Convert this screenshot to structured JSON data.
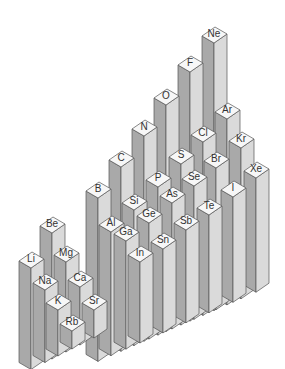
{
  "diagram": {
    "type": "isometric-3d-bar-periodic-table",
    "colors": {
      "top_face": "#f7f7f7",
      "left_face": "#a9a9a9",
      "right_face": "#dadada",
      "edge": "#555555",
      "label": "#333333",
      "background": "#ffffff"
    },
    "left_block": {
      "groups": [
        {
          "group": 1,
          "elements": [
            "Li",
            "Na",
            "K",
            "Rb"
          ]
        },
        {
          "group": 2,
          "elements": [
            "Be",
            "Mg",
            "Ca",
            "Sr"
          ]
        }
      ]
    },
    "right_block": {
      "groups": [
        {
          "group": 13,
          "elements": [
            "B",
            "Al",
            "Ga",
            "In"
          ]
        },
        {
          "group": 14,
          "elements": [
            "C",
            "Si",
            "Ge",
            "Sn"
          ]
        },
        {
          "group": 15,
          "elements": [
            "N",
            "P",
            "As",
            "Sb"
          ]
        },
        {
          "group": 16,
          "elements": [
            "O",
            "S",
            "Se",
            "Te"
          ]
        },
        {
          "group": 17,
          "elements": [
            "F",
            "Cl",
            "Br",
            "I"
          ]
        },
        {
          "group": 18,
          "elements": [
            "Ne",
            "Ar",
            "Kr",
            "Xe"
          ]
        }
      ]
    },
    "columns": [
      {
        "symbol": "Ne",
        "cx": 214,
        "cy": 33
      },
      {
        "symbol": "F",
        "cx": 190,
        "cy": 62
      },
      {
        "symbol": "O",
        "cx": 166,
        "cy": 95
      },
      {
        "symbol": "N",
        "cx": 144,
        "cy": 126
      },
      {
        "symbol": "C",
        "cx": 121,
        "cy": 157
      },
      {
        "symbol": "B",
        "cx": 98,
        "cy": 188
      },
      {
        "symbol": "Ar",
        "cx": 227,
        "cy": 109
      },
      {
        "symbol": "Cl",
        "cx": 203,
        "cy": 132
      },
      {
        "symbol": "S",
        "cx": 181,
        "cy": 154
      },
      {
        "symbol": "P",
        "cx": 158,
        "cy": 177
      },
      {
        "symbol": "Si",
        "cx": 134,
        "cy": 200
      },
      {
        "symbol": "Al",
        "cx": 111,
        "cy": 222
      },
      {
        "symbol": "Kr",
        "cx": 241,
        "cy": 138
      },
      {
        "symbol": "Br",
        "cx": 216,
        "cy": 158
      },
      {
        "symbol": "Se",
        "cx": 194,
        "cy": 176
      },
      {
        "symbol": "As",
        "cx": 172,
        "cy": 193
      },
      {
        "symbol": "Ge",
        "cx": 149,
        "cy": 213
      },
      {
        "symbol": "Ga",
        "cx": 126,
        "cy": 231
      },
      {
        "symbol": "Xe",
        "cx": 256,
        "cy": 168
      },
      {
        "symbol": "I",
        "cx": 233,
        "cy": 187
      },
      {
        "symbol": "Te",
        "cx": 209,
        "cy": 205
      },
      {
        "symbol": "Sb",
        "cx": 186,
        "cy": 220
      },
      {
        "symbol": "Sn",
        "cx": 163,
        "cy": 239
      },
      {
        "symbol": "In",
        "cx": 140,
        "cy": 252
      },
      {
        "symbol": "Be",
        "cx": 52,
        "cy": 223
      },
      {
        "symbol": "Li",
        "cx": 31,
        "cy": 258
      },
      {
        "symbol": "Mg",
        "cx": 66,
        "cy": 252
      },
      {
        "symbol": "Na",
        "cx": 45,
        "cy": 280
      },
      {
        "symbol": "Ca",
        "cx": 80,
        "cy": 277
      },
      {
        "symbol": "K",
        "cx": 58,
        "cy": 300
      },
      {
        "symbol": "Sr",
        "cx": 94,
        "cy": 300
      },
      {
        "symbol": "Rb",
        "cx": 72,
        "cy": 321
      }
    ]
  }
}
